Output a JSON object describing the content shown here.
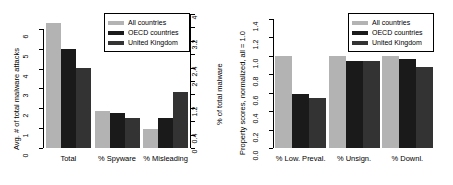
{
  "legend": {
    "position": "top-right",
    "entries": [
      {
        "label": "All countries",
        "color": "#b3b3b3"
      },
      {
        "label": "OECD countries",
        "color": "#1a1a1a"
      },
      {
        "label": "United Kingdom",
        "color": "#333333"
      }
    ]
  },
  "chart_data": [
    {
      "type": "bar",
      "panel": "left",
      "title": "",
      "xlabel": "",
      "ylabel": "Avg. # of total malware attacks",
      "y2label": "% of total malware",
      "categories": [
        "Total",
        "% Spyware",
        "% Misleading"
      ],
      "series": [
        {
          "name": "All countries",
          "color": "#b3b3b3",
          "values": [
            6.3,
            1.85,
            0.97
          ]
        },
        {
          "name": "OECD countries",
          "color": "#1a1a1a",
          "values": [
            5.0,
            1.78,
            1.52
          ]
        },
        {
          "name": "United Kingdom",
          "color": "#333333",
          "values": [
            4.05,
            1.5,
            2.82
          ]
        }
      ],
      "ylim": [
        0,
        6.75
      ],
      "yticks": [
        0,
        1,
        2,
        3,
        4,
        5,
        6
      ],
      "yticklabels": [
        "0",
        "1",
        "2",
        "3",
        "4",
        "5",
        "6"
      ],
      "y2lim": [
        0,
        4
      ],
      "y2ticks": [
        0,
        0.4,
        0.8,
        1.2,
        1.6,
        2.0,
        2.4,
        2.8,
        3.2,
        3.6,
        4.0
      ],
      "y2ticklabels": [
        "0",
        "0.4",
        "",
        "1.2",
        "",
        "2",
        "2.4",
        "",
        "3.2",
        "",
        "4"
      ],
      "grid": false
    },
    {
      "type": "bar",
      "panel": "right",
      "title": "",
      "xlabel": "",
      "ylabel": "Property scores, normalized, all = 1.0",
      "categories": [
        "% Low. Preval.",
        "% Unsign.",
        "% Downl."
      ],
      "series": [
        {
          "name": "All countries",
          "color": "#b3b3b3",
          "values": [
            1.0,
            1.0,
            1.0
          ]
        },
        {
          "name": "OECD countries",
          "color": "#1a1a1a",
          "values": [
            0.58,
            0.94,
            0.96
          ]
        },
        {
          "name": "United Kingdom",
          "color": "#333333",
          "values": [
            0.545,
            0.94,
            0.875
          ]
        }
      ],
      "ylim": [
        0,
        1.45
      ],
      "yticks": [
        0.0,
        0.2,
        0.4,
        0.6,
        0.8,
        1.0,
        1.2,
        1.4
      ],
      "yticklabels": [
        "0.0",
        "0.2",
        "0.4",
        "0.6",
        "0.8",
        "1.0",
        "1.2",
        "1.4"
      ],
      "grid": false
    }
  ]
}
